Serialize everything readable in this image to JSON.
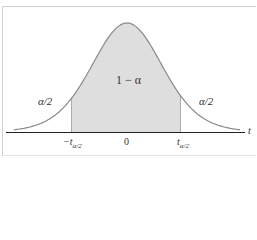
{
  "chart_data": {
    "type": "area",
    "title": "",
    "xlabel": "t",
    "ylabel": "",
    "x_ticks": [
      "-t_{α/2}",
      "0",
      "t_{α/2}"
    ],
    "regions": [
      {
        "name": "left tail",
        "label": "α/2",
        "shaded": false
      },
      {
        "name": "center",
        "label": "1 − α",
        "shaded": true
      },
      {
        "name": "right tail",
        "label": "α/2",
        "shaded": false
      }
    ],
    "grid": false,
    "legend": null
  },
  "labels": {
    "center_area": "1 − α",
    "left_tail": "α/2",
    "right_tail": "α/2",
    "axis_var": "t",
    "tick_zero": "0",
    "tick_left_main": "−t",
    "tick_right_main": "t",
    "tick_sub": "α/2"
  },
  "colors": {
    "shade": "#dedede",
    "curve": "#8a8a8a",
    "axis": "#222222",
    "bound": "#9a9a9a"
  }
}
